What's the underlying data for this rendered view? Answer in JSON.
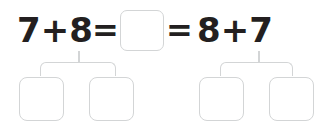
{
  "worksheet": {
    "type": "math-number-bond-exercise",
    "equation": {
      "left_expression": "7+8",
      "equals_1": "=",
      "sum_box_value": "",
      "equals_2": "=",
      "right_expression": "8+7"
    },
    "addends": {
      "left_pair": [
        "7",
        "8"
      ],
      "right_pair": [
        "8",
        "7"
      ]
    },
    "answer_boxes": [
      {
        "id": "box-sum",
        "value": "",
        "group": "sum"
      },
      {
        "id": "box-a1",
        "value": "",
        "group": "left-pair"
      },
      {
        "id": "box-a2",
        "value": "",
        "group": "left-pair"
      },
      {
        "id": "box-b1",
        "value": "",
        "group": "right-pair"
      },
      {
        "id": "box-b2",
        "value": "",
        "group": "right-pair"
      }
    ],
    "connectors": [
      {
        "id": "tree-left",
        "label": "left-number-bond-bracket"
      },
      {
        "id": "tree-right",
        "label": "right-number-bond-bracket"
      }
    ],
    "colors": {
      "text": "#231f20",
      "box_border": "#d3d5d6",
      "connector": "#d3d5d6",
      "background": "#ffffff"
    }
  }
}
